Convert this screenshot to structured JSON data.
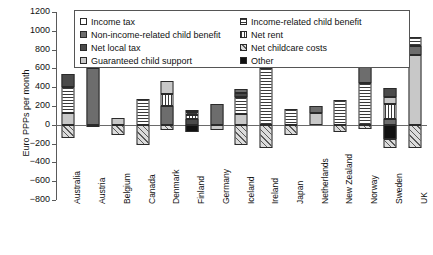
{
  "chart_data": {
    "type": "bar",
    "title": "",
    "xlabel": "",
    "ylabel": "Euro PPPs per month",
    "ylim": [
      -800,
      1200
    ],
    "ytick_values": [
      1200,
      1000,
      800,
      600,
      400,
      200,
      0,
      -200,
      -400,
      -600,
      -800
    ],
    "ytick_labels": [
      "1200",
      "1000",
      "800",
      "600",
      "400",
      "200",
      "0",
      "-200",
      "-400",
      "-600",
      "-800"
    ],
    "grid": false,
    "stacked": true,
    "legend_position": "top-center",
    "categories": [
      "Australia",
      "Austria",
      "Belgium",
      "Canada",
      "Denmark",
      "Finland",
      "Germany",
      "Iceland",
      "Ireland",
      "Japan",
      "Netherlands",
      "New Zealand",
      "Norway",
      "Sweden",
      "UK"
    ],
    "series": [
      {
        "name": "Income tax",
        "pattern": "white",
        "values": [
          0,
          0,
          0,
          0,
          0,
          0,
          0,
          0,
          0,
          0,
          0,
          0,
          0,
          0,
          0
        ]
      },
      {
        "name": "Non-income-related child benefit",
        "pattern": "dark-gray",
        "values": [
          140,
          600,
          0,
          0,
          140,
          60,
          120,
          60,
          80,
          0,
          80,
          0,
          180,
          60,
          90
        ]
      },
      {
        "name": "Net local tax",
        "pattern": "darker-gray",
        "values": [
          0,
          0,
          0,
          0,
          0,
          0,
          0,
          0,
          0,
          0,
          0,
          0,
          0,
          0,
          0
        ]
      },
      {
        "name": "Guaranteed child support",
        "pattern": "light-gray",
        "values": [
          130,
          0,
          75,
          0,
          0,
          0,
          100,
          110,
          0,
          0,
          0,
          100,
          0,
          60,
          740
        ]
      },
      {
        "name": "Income-related child benefit",
        "pattern": "horizontal-stripes",
        "values": [
          270,
          0,
          0,
          270,
          200,
          60,
          0,
          210,
          600,
          170,
          0,
          160,
          440,
          0,
          0
        ]
      },
      {
        "name": "Net rent",
        "pattern": "vertical-stripes",
        "values": [
          0,
          0,
          0,
          0,
          130,
          40,
          0,
          0,
          0,
          0,
          0,
          0,
          0,
          120,
          0
        ]
      },
      {
        "name": "Net childcare costs",
        "pattern": "diagonal-hatch",
        "values": [
          -140,
          0,
          -105,
          -215,
          -55,
          0,
          0,
          -215,
          -250,
          -105,
          0,
          -75,
          -40,
          -95,
          -250
        ]
      },
      {
        "name": "Other",
        "pattern": "black",
        "values": [
          0,
          0,
          0,
          0,
          0,
          -80,
          0,
          0,
          0,
          0,
          0,
          0,
          0,
          -150,
          0
        ]
      }
    ],
    "bar_totals_positive": [
      540,
      750,
      75,
      270,
      470,
      160,
      220,
      380,
      680,
      170,
      200,
      260,
      770,
      390,
      935
    ],
    "bar_totals_negative": [
      -140,
      0,
      -105,
      -215,
      -55,
      -80,
      0,
      -215,
      -250,
      -105,
      0,
      -75,
      -40,
      -245,
      -250
    ],
    "stacks": [
      {
        "category": "Australia",
        "segments": [
          {
            "series": "Guaranteed child support",
            "pattern": "light-gray",
            "from": 0,
            "to": 130
          },
          {
            "series": "Income-related child benefit",
            "pattern": "horizontal-stripes",
            "from": 130,
            "to": 400
          },
          {
            "series": "Non-income-related child benefit",
            "pattern": "darker-gray",
            "from": 400,
            "to": 540
          },
          {
            "series": "Net childcare costs",
            "pattern": "diagonal-hatch",
            "from": 0,
            "to": -140
          }
        ]
      },
      {
        "category": "Austria",
        "segments": [
          {
            "series": "Non-income-related child benefit",
            "pattern": "dark-gray",
            "from": 0,
            "to": 600
          },
          {
            "series": "Income tax",
            "pattern": "light-gray",
            "from": 600,
            "to": 750
          },
          {
            "series": "Net childcare costs",
            "pattern": "diagonal-hatch",
            "from": 0,
            "to": -25
          }
        ]
      },
      {
        "category": "Belgium",
        "segments": [
          {
            "series": "Guaranteed child support",
            "pattern": "light-gray",
            "from": 0,
            "to": 75
          },
          {
            "series": "Net childcare costs",
            "pattern": "diagonal-hatch",
            "from": 0,
            "to": -105
          }
        ]
      },
      {
        "category": "Canada",
        "segments": [
          {
            "series": "Income-related child benefit",
            "pattern": "horizontal-stripes",
            "from": 0,
            "to": 270
          },
          {
            "series": "Net childcare costs",
            "pattern": "diagonal-hatch",
            "from": 0,
            "to": -215
          }
        ]
      },
      {
        "category": "Denmark",
        "segments": [
          {
            "series": "Non-income-related child benefit",
            "pattern": "dark-gray",
            "from": 0,
            "to": 200
          },
          {
            "series": "Net rent",
            "pattern": "vertical-stripes",
            "from": 200,
            "to": 330
          },
          {
            "series": "Income tax",
            "pattern": "light-gray",
            "from": 330,
            "to": 470
          },
          {
            "series": "Net childcare costs",
            "pattern": "diagonal-hatch",
            "from": 0,
            "to": -55
          }
        ]
      },
      {
        "category": "Finland",
        "segments": [
          {
            "series": "Non-income-related child benefit",
            "pattern": "darker-gray",
            "from": 0,
            "to": 60
          },
          {
            "series": "Net rent",
            "pattern": "vertical-stripes",
            "from": 60,
            "to": 100
          },
          {
            "series": "Income-related child benefit",
            "pattern": "horizontal-stripes",
            "from": 100,
            "to": 135
          },
          {
            "series": "Income tax",
            "pattern": "light-gray",
            "from": 135,
            "to": 160
          },
          {
            "series": "Other",
            "pattern": "black",
            "from": 0,
            "to": -80
          }
        ]
      },
      {
        "category": "Germany",
        "segments": [
          {
            "series": "Non-income-related child benefit",
            "pattern": "dark-gray",
            "from": 0,
            "to": 220
          },
          {
            "series": "Guaranteed child support",
            "pattern": "light-gray",
            "from": 0,
            "to": -60
          }
        ]
      },
      {
        "category": "Iceland",
        "segments": [
          {
            "series": "Guaranteed child support",
            "pattern": "light-gray",
            "from": 0,
            "to": 110
          },
          {
            "series": "Income-related child benefit",
            "pattern": "horizontal-stripes",
            "from": 110,
            "to": 300
          },
          {
            "series": "Net local tax",
            "pattern": "darker-gray",
            "from": 300,
            "to": 340
          },
          {
            "series": "Non-income-related child benefit",
            "pattern": "dark-gray",
            "from": 340,
            "to": 380
          },
          {
            "series": "Net childcare costs",
            "pattern": "diagonal-hatch",
            "from": 0,
            "to": -215
          }
        ]
      },
      {
        "category": "Ireland",
        "segments": [
          {
            "series": "Income-related child benefit",
            "pattern": "horizontal-stripes",
            "from": 0,
            "to": 600
          },
          {
            "series": "Non-income-related child benefit",
            "pattern": "dark-gray",
            "from": 600,
            "to": 680
          },
          {
            "series": "Net childcare costs",
            "pattern": "diagonal-hatch",
            "from": 0,
            "to": -250
          }
        ]
      },
      {
        "category": "Japan",
        "segments": [
          {
            "series": "Income-related child benefit",
            "pattern": "horizontal-stripes",
            "from": 0,
            "to": 170
          },
          {
            "series": "Net childcare costs",
            "pattern": "diagonal-hatch",
            "from": 0,
            "to": -105
          }
        ]
      },
      {
        "category": "Netherlands",
        "segments": [
          {
            "series": "Income tax",
            "pattern": "light-gray",
            "from": 0,
            "to": 130
          },
          {
            "series": "Non-income-related child benefit",
            "pattern": "dark-gray",
            "from": 130,
            "to": 200
          }
        ]
      },
      {
        "category": "New Zealand",
        "segments": [
          {
            "series": "Income-related child benefit",
            "pattern": "horizontal-stripes",
            "from": 0,
            "to": 260
          },
          {
            "series": "Net childcare costs",
            "pattern": "diagonal-hatch",
            "from": 0,
            "to": -75
          }
        ]
      },
      {
        "category": "Norway",
        "segments": [
          {
            "series": "Income-related child benefit",
            "pattern": "horizontal-stripes",
            "from": 0,
            "to": 440
          },
          {
            "series": "Non-income-related child benefit",
            "pattern": "dark-gray",
            "from": 440,
            "to": 620
          },
          {
            "series": "Guaranteed child support",
            "pattern": "light-gray",
            "from": 620,
            "to": 700
          },
          {
            "series": "Net local tax",
            "pattern": "darker-gray",
            "from": 700,
            "to": 770
          },
          {
            "series": "Net childcare costs",
            "pattern": "diagonal-hatch",
            "from": 0,
            "to": -40
          }
        ]
      },
      {
        "category": "Sweden",
        "segments": [
          {
            "series": "Non-income-related child benefit",
            "pattern": "dark-gray",
            "from": 0,
            "to": 60
          },
          {
            "series": "Net rent",
            "pattern": "vertical-stripes",
            "from": 60,
            "to": 220
          },
          {
            "series": "Guaranteed child support",
            "pattern": "light-gray",
            "from": 220,
            "to": 300
          },
          {
            "series": "Non-income-related child benefit",
            "pattern": "darker-gray",
            "from": 300,
            "to": 390
          },
          {
            "series": "Other",
            "pattern": "black",
            "from": 0,
            "to": -150
          },
          {
            "series": "Net childcare costs",
            "pattern": "diagonal-hatch",
            "from": -150,
            "to": -245
          }
        ]
      },
      {
        "category": "UK",
        "segments": [
          {
            "series": "Guaranteed child support",
            "pattern": "light-gray",
            "from": 0,
            "to": 740
          },
          {
            "series": "Non-income-related child benefit",
            "pattern": "dark-gray",
            "from": 740,
            "to": 840
          },
          {
            "series": "Income-related child benefit",
            "pattern": "horizontal-stripes",
            "from": 840,
            "to": 935
          },
          {
            "series": "Net childcare costs",
            "pattern": "diagonal-hatch",
            "from": 0,
            "to": -250
          }
        ]
      }
    ],
    "legend": {
      "left_column": [
        {
          "label": "Income tax",
          "pattern": "white"
        },
        {
          "label": "Non-income-related child benefit",
          "pattern": "dark-gray"
        },
        {
          "label": "Net local tax",
          "pattern": "darker-gray"
        },
        {
          "label": "Guaranteed child support",
          "pattern": "light-gray"
        }
      ],
      "right_column": [
        {
          "label": "Income-related child benefit",
          "pattern": "horizontal-stripes"
        },
        {
          "label": "Net rent",
          "pattern": "vertical-stripes"
        },
        {
          "label": "Net childcare costs",
          "pattern": "diagonal-hatch"
        },
        {
          "label": "Other",
          "pattern": "black"
        }
      ]
    }
  }
}
